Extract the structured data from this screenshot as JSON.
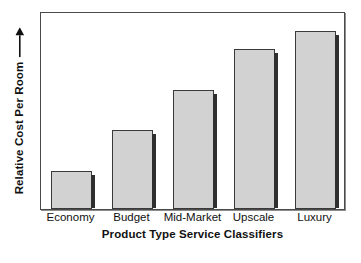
{
  "chart_data": {
    "type": "bar",
    "title": "",
    "subtitle": "",
    "xlabel": "Product Type Service Classifiers",
    "ylabel": "Relative Cost Per Room",
    "ylabel_arrow": "→",
    "categories": [
      "Economy",
      "Budget",
      "Mid-Market",
      "Upscale",
      "Luxury"
    ],
    "values": [
      19,
      40,
      60,
      81,
      90
    ],
    "ylim": [
      0,
      100
    ],
    "ytick_labels": [],
    "grid": false,
    "legend": null,
    "legend_position": "none",
    "annotations": [],
    "series": [
      {
        "name": "Relative Cost Per Room",
        "values": [
          19,
          40,
          60,
          81,
          90
        ]
      }
    ]
  },
  "style": {
    "bar_fill": "#d2d2d2",
    "bar_border": "#3a3a3a",
    "bar_shadow": "#2f2f2f",
    "frame_border": "#4a4a4a",
    "background": "#ffffff",
    "text_color": "#111111"
  }
}
